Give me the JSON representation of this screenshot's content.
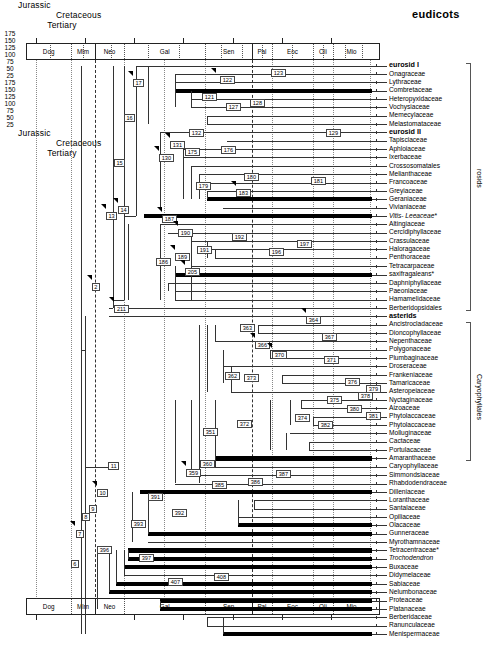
{
  "title": "eudicots",
  "axis": {
    "eras": [
      {
        "name": "Jurassic",
        "start": 180,
        "end": 145
      },
      {
        "name": "Cretaceous",
        "start": 145,
        "end": 65
      },
      {
        "name": "Tertiary",
        "start": 65,
        "end": 2
      }
    ],
    "ticks": [
      175,
      150,
      125,
      100,
      75,
      50,
      25
    ],
    "epochs": [
      {
        "name": "Dog",
        "start": 180,
        "end": 157
      },
      {
        "name": "Mlm",
        "start": 157,
        "end": 145
      },
      {
        "name": "Neo",
        "start": 145,
        "end": 130
      },
      {
        "name": "Gal",
        "start": 130,
        "end": 89
      },
      {
        "name": "Sen",
        "start": 89,
        "end": 65
      },
      {
        "name": "Pal",
        "start": 65,
        "end": 55
      },
      {
        "name": "Eoc",
        "start": 55,
        "end": 34
      },
      {
        "name": "Oli",
        "start": 34,
        "end": 24
      },
      {
        "name": "Mio",
        "start": 24,
        "end": 5
      }
    ]
  },
  "brackets": [
    {
      "label": "rosids",
      "from_row": 0,
      "to_row": 29
    },
    {
      "label": "Caryophyllales",
      "from_row": 31,
      "to_row": 47
    }
  ],
  "taxa": [
    {
      "name": "eurosid I",
      "style": "bold",
      "bar": false
    },
    {
      "name": "Onagraceae",
      "style": "plain",
      "bar": false
    },
    {
      "name": "Lythraceae",
      "style": "plain",
      "bar": false
    },
    {
      "name": "Combretaceae",
      "style": "plain",
      "bar": true
    },
    {
      "name": "Heteropyxidaceae",
      "style": "plain",
      "bar": false
    },
    {
      "name": "Vochysiaceae",
      "style": "plain",
      "bar": false
    },
    {
      "name": "Memecylaceae",
      "style": "plain",
      "bar": false
    },
    {
      "name": "Melastomataceae",
      "style": "plain",
      "bar": false
    },
    {
      "name": "eurosid II",
      "style": "bold",
      "bar": false
    },
    {
      "name": "Tapisciaceae",
      "style": "plain",
      "bar": false
    },
    {
      "name": "Aphloiaceae",
      "style": "plain",
      "bar": false
    },
    {
      "name": "Ixerbaceae",
      "style": "plain",
      "bar": false
    },
    {
      "name": "Crossosomatales",
      "style": "plain",
      "bar": false
    },
    {
      "name": "Melianthaceae",
      "style": "plain",
      "bar": false
    },
    {
      "name": "Francoaceae",
      "style": "plain",
      "bar": false
    },
    {
      "name": "Greyiaceae",
      "style": "plain",
      "bar": false
    },
    {
      "name": "Geraniaceae",
      "style": "plain",
      "bar": true
    },
    {
      "name": "Vivianiaceae",
      "style": "plain",
      "bar": false
    },
    {
      "name": "Vitis- Leeaceae*",
      "style": "ital",
      "bar": true
    },
    {
      "name": "Altingiaceae",
      "style": "plain",
      "bar": false
    },
    {
      "name": "Cercidiphyllaceae",
      "style": "plain",
      "bar": false
    },
    {
      "name": "Crassulaceae",
      "style": "plain",
      "bar": false
    },
    {
      "name": "Haloragaceae",
      "style": "plain",
      "bar": false
    },
    {
      "name": "Penthoraceae",
      "style": "plain",
      "bar": false
    },
    {
      "name": "Tetracarpaceae",
      "style": "plain",
      "bar": false
    },
    {
      "name": "saxifragaleans*",
      "style": "plain",
      "bar": true
    },
    {
      "name": "Daphniphyllaceae",
      "style": "plain",
      "bar": false
    },
    {
      "name": "Paeoniaceae",
      "style": "plain",
      "bar": false
    },
    {
      "name": "Hamamelidaceae",
      "style": "plain",
      "bar": false
    },
    {
      "name": "Berberidopsidales",
      "style": "plain",
      "bar": false
    },
    {
      "name": "asterids",
      "style": "bold",
      "bar": false
    },
    {
      "name": "Ancistrocladaceae",
      "style": "plain",
      "bar": false
    },
    {
      "name": "Dioncophyllaceae",
      "style": "plain",
      "bar": false
    },
    {
      "name": "Nepenthaceae",
      "style": "plain",
      "bar": false
    },
    {
      "name": "Polygonaceae",
      "style": "plain",
      "bar": false
    },
    {
      "name": "Plumbaginaceae",
      "style": "plain",
      "bar": false
    },
    {
      "name": "Droseraceae",
      "style": "plain",
      "bar": false
    },
    {
      "name": "Frankeniaceae",
      "style": "plain",
      "bar": false
    },
    {
      "name": "Tamaricaceae",
      "style": "plain",
      "bar": false
    },
    {
      "name": "Asteropeiaceae",
      "style": "plain",
      "bar": false
    },
    {
      "name": "Nyctaginaceae",
      "style": "plain",
      "bar": false
    },
    {
      "name": "Aizoaceae",
      "style": "plain",
      "bar": false
    },
    {
      "name": "Phytolaccaceae",
      "style": "plain",
      "bar": false
    },
    {
      "name": "Phytolaccaceae",
      "style": "plain",
      "bar": false
    },
    {
      "name": "Molluginaceae",
      "style": "plain",
      "bar": false
    },
    {
      "name": "Cactaceae",
      "style": "plain",
      "bar": false
    },
    {
      "name": "Portulacaceae",
      "style": "plain",
      "bar": false
    },
    {
      "name": "Amaranthaceae",
      "style": "plain",
      "bar": true
    },
    {
      "name": "Caryophyllaceae",
      "style": "plain",
      "bar": false
    },
    {
      "name": "Simmondsiaceae",
      "style": "plain",
      "bar": false
    },
    {
      "name": "Rhabdodendraceae",
      "style": "plain",
      "bar": false
    },
    {
      "name": "Dilleniaceae",
      "style": "plain",
      "bar": true
    },
    {
      "name": "Loranthaceae",
      "style": "plain",
      "bar": false
    },
    {
      "name": "Santalaceae",
      "style": "plain",
      "bar": false
    },
    {
      "name": "Opiliaceae",
      "style": "plain",
      "bar": false
    },
    {
      "name": "Olacaceae",
      "style": "plain",
      "bar": true
    },
    {
      "name": "Gunneraceae",
      "style": "plain",
      "bar": true
    },
    {
      "name": "Myrothamnaceae",
      "style": "plain",
      "bar": false
    },
    {
      "name": "Tetracentraceae*",
      "style": "plain",
      "bar": true
    },
    {
      "name": "Trochodendron",
      "style": "ital",
      "bar": true
    },
    {
      "name": "Buxaceae",
      "style": "plain",
      "bar": true
    },
    {
      "name": "Didymelaceae",
      "style": "plain",
      "bar": false
    },
    {
      "name": "Sabiaceae",
      "style": "plain",
      "bar": true
    },
    {
      "name": "Nelumbonaceae",
      "style": "plain",
      "bar": true
    },
    {
      "name": "Proteaceae",
      "style": "plain",
      "bar": true
    },
    {
      "name": "Platanaceae",
      "style": "plain",
      "bar": true
    },
    {
      "name": "Berberidaceae",
      "style": "plain",
      "bar": false
    },
    {
      "name": "Ranunculaceae",
      "style": "plain",
      "bar": false
    },
    {
      "name": "Menispermaceae",
      "style": "plain",
      "bar": true
    }
  ],
  "nodes": [
    {
      "id": "17",
      "x": 133,
      "y": 79
    },
    {
      "id": "122",
      "x": 220,
      "y": 76
    },
    {
      "id": "123",
      "x": 271,
      "y": 69
    },
    {
      "id": "121",
      "x": 202,
      "y": 93
    },
    {
      "id": "127",
      "x": 226,
      "y": 103
    },
    {
      "id": "128",
      "x": 250,
      "y": 99
    },
    {
      "id": "16",
      "x": 124,
      "y": 114
    },
    {
      "id": "132",
      "x": 189,
      "y": 129
    },
    {
      "id": "129",
      "x": 326,
      "y": 129
    },
    {
      "id": "131",
      "x": 170,
      "y": 141
    },
    {
      "id": "175",
      "x": 185,
      "y": 148
    },
    {
      "id": "176",
      "x": 221,
      "y": 146
    },
    {
      "id": "130",
      "x": 159,
      "y": 154
    },
    {
      "id": "15",
      "x": 114,
      "y": 159
    },
    {
      "id": "179",
      "x": 196,
      "y": 182
    },
    {
      "id": "180",
      "x": 244,
      "y": 173
    },
    {
      "id": "181",
      "x": 311,
      "y": 177
    },
    {
      "id": "183",
      "x": 236,
      "y": 189
    },
    {
      "id": "14",
      "x": 118,
      "y": 206
    },
    {
      "id": "13",
      "x": 106,
      "y": 212
    },
    {
      "id": "187",
      "x": 162,
      "y": 215
    },
    {
      "id": "190",
      "x": 178,
      "y": 229
    },
    {
      "id": "192",
      "x": 232,
      "y": 233
    },
    {
      "id": "197",
      "x": 297,
      "y": 240
    },
    {
      "id": "191",
      "x": 197,
      "y": 246
    },
    {
      "id": "196",
      "x": 269,
      "y": 248
    },
    {
      "id": "189",
      "x": 175,
      "y": 253
    },
    {
      "id": "186",
      "x": 156,
      "y": 258
    },
    {
      "id": "205",
      "x": 185,
      "y": 268
    },
    {
      "id": "2",
      "x": 92,
      "y": 283
    },
    {
      "id": "211",
      "x": 114,
      "y": 305
    },
    {
      "id": "364",
      "x": 306,
      "y": 316
    },
    {
      "id": "363",
      "x": 240,
      "y": 324
    },
    {
      "id": "367",
      "x": 322,
      "y": 333
    },
    {
      "id": "366",
      "x": 255,
      "y": 341
    },
    {
      "id": "370",
      "x": 272,
      "y": 351
    },
    {
      "id": "371",
      "x": 324,
      "y": 356
    },
    {
      "id": "362",
      "x": 225,
      "y": 372
    },
    {
      "id": "373",
      "x": 244,
      "y": 374
    },
    {
      "id": "376",
      "x": 345,
      "y": 378
    },
    {
      "id": "379",
      "x": 366,
      "y": 385
    },
    {
      "id": "378",
      "x": 358,
      "y": 392
    },
    {
      "id": "375",
      "x": 327,
      "y": 396
    },
    {
      "id": "380",
      "x": 347,
      "y": 405
    },
    {
      "id": "381",
      "x": 366,
      "y": 412
    },
    {
      "id": "374",
      "x": 295,
      "y": 414
    },
    {
      "id": "372",
      "x": 237,
      "y": 420
    },
    {
      "id": "382",
      "x": 318,
      "y": 421
    },
    {
      "id": "351",
      "x": 203,
      "y": 428
    },
    {
      "id": "360",
      "x": 200,
      "y": 460
    },
    {
      "id": "359",
      "x": 186,
      "y": 469
    },
    {
      "id": "387",
      "x": 276,
      "y": 470
    },
    {
      "id": "386",
      "x": 248,
      "y": 478
    },
    {
      "id": "385",
      "x": 212,
      "y": 481
    },
    {
      "id": "11",
      "x": 108,
      "y": 462
    },
    {
      "id": "391",
      "x": 148,
      "y": 493
    },
    {
      "id": "10",
      "x": 97,
      "y": 489
    },
    {
      "id": "392",
      "x": 172,
      "y": 509
    },
    {
      "id": "9",
      "x": 89,
      "y": 505
    },
    {
      "id": "393",
      "x": 131,
      "y": 520
    },
    {
      "id": "8",
      "x": 82,
      "y": 513
    },
    {
      "id": "7",
      "x": 76,
      "y": 530
    },
    {
      "id": "396",
      "x": 97,
      "y": 546
    },
    {
      "id": "397",
      "x": 139,
      "y": 554
    },
    {
      "id": "6",
      "x": 71,
      "y": 560
    },
    {
      "id": "407",
      "x": 168,
      "y": 578
    },
    {
      "id": "408",
      "x": 214,
      "y": 573
    }
  ],
  "arrows": [
    {
      "x": 128,
      "y": 71
    },
    {
      "x": 211,
      "y": 68
    },
    {
      "x": 165,
      "y": 133
    },
    {
      "x": 154,
      "y": 146
    },
    {
      "x": 231,
      "y": 181
    },
    {
      "x": 113,
      "y": 198
    },
    {
      "x": 101,
      "y": 204
    },
    {
      "x": 157,
      "y": 207
    },
    {
      "x": 173,
      "y": 221
    },
    {
      "x": 170,
      "y": 245
    },
    {
      "x": 180,
      "y": 260
    },
    {
      "x": 87,
      "y": 275
    },
    {
      "x": 109,
      "y": 297
    },
    {
      "x": 301,
      "y": 308
    },
    {
      "x": 250,
      "y": 333
    },
    {
      "x": 267,
      "y": 343
    },
    {
      "x": 181,
      "y": 461
    },
    {
      "x": 92,
      "y": 481
    },
    {
      "x": 70,
      "y": 521
    }
  ],
  "guides": [
    {
      "time": 145,
      "style": "dashed"
    },
    {
      "time": 65,
      "style": "dashed"
    },
    {
      "time": 175,
      "style": "dotted"
    },
    {
      "time": 157,
      "style": "dotted"
    },
    {
      "time": 130,
      "style": "dotted"
    },
    {
      "time": 110,
      "style": "dotted"
    },
    {
      "time": 89,
      "style": "dotted"
    },
    {
      "time": 55,
      "style": "dotted"
    },
    {
      "time": 34,
      "style": "dotted"
    },
    {
      "time": 24,
      "style": "dotted"
    },
    {
      "time": 5,
      "style": "dotted"
    }
  ]
}
